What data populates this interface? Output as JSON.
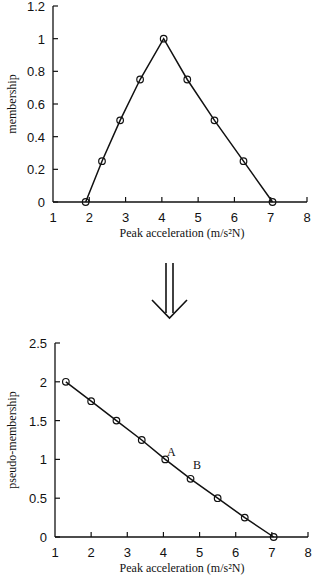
{
  "chart_data": [
    {
      "type": "line",
      "title": "",
      "xlabel": "Peak acceleration (m/s²N)",
      "ylabel": "membership",
      "xlim": [
        1,
        8
      ],
      "ylim": [
        0,
        1.2
      ],
      "xticks": [
        "1",
        "2",
        "3",
        "4",
        "5",
        "6",
        "7",
        "8"
      ],
      "yticks": [
        "0",
        "0.2",
        "0.4",
        "0.6",
        "0.8",
        "1",
        "1.2"
      ],
      "grid": false,
      "marker": "circle",
      "series": [
        {
          "name": "membership",
          "x": [
            1.9,
            2.35,
            2.85,
            3.4,
            4.05,
            4.7,
            5.45,
            6.25,
            7.05
          ],
          "values": [
            0,
            0.25,
            0.5,
            0.75,
            1.0,
            0.75,
            0.5,
            0.25,
            0
          ]
        }
      ]
    },
    {
      "type": "line",
      "title": "",
      "xlabel": "Peak acceleration (m/s²N)",
      "ylabel": "pseudo-membership",
      "xlim": [
        1,
        8
      ],
      "ylim": [
        0,
        2.5
      ],
      "xticks": [
        "1",
        "2",
        "3",
        "4",
        "5",
        "6",
        "7",
        "8"
      ],
      "yticks": [
        "0",
        "0.5",
        "1",
        "1.5",
        "2",
        "2.5"
      ],
      "grid": false,
      "marker": "circle",
      "series": [
        {
          "name": "pseudo-membership",
          "x": [
            1.3,
            2.0,
            2.7,
            3.4,
            4.05,
            4.75,
            5.5,
            6.25,
            7.05
          ],
          "values": [
            2.0,
            1.75,
            1.5,
            1.25,
            1.0,
            0.75,
            0.5,
            0.25,
            0
          ]
        }
      ],
      "annotations": [
        {
          "text": "A",
          "x": 4.1,
          "y": 1.1
        },
        {
          "text": "B",
          "x": 4.85,
          "y": 0.95
        }
      ]
    }
  ],
  "top": {
    "ylabel": "membership",
    "xlabel": "Peak acceleration (m/s²N)"
  },
  "bottom": {
    "ylabel": "pseudo-membership",
    "xlabel": "Peak acceleration (m/s²N)",
    "annA": "A",
    "annB": "B"
  },
  "arrow": {
    "icon": "double-down-arrow"
  }
}
